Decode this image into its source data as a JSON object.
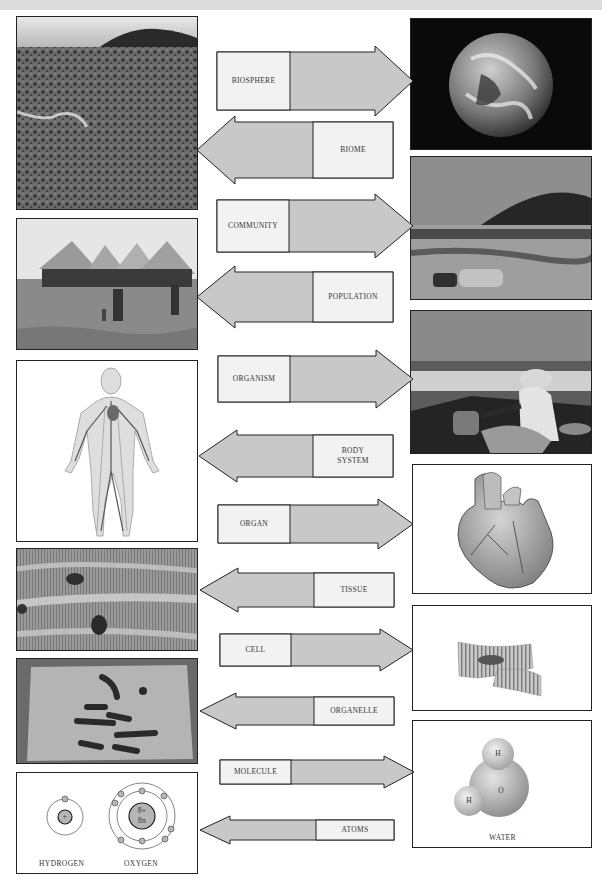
{
  "colors": {
    "arrow_fill": "#c8c8c8",
    "label_fill": "#f2f2f2",
    "stroke": "#222222",
    "top_bar": "#dcdcdc"
  },
  "levels": [
    {
      "label": "BIOSPHERE",
      "direction": "right",
      "image": "earth-photo"
    },
    {
      "label": "BIOME",
      "direction": "left",
      "image": "savanna-landscape-photo"
    },
    {
      "label": "COMMUNITY",
      "direction": "right",
      "image": "village-hill-landscape-photo"
    },
    {
      "label": "POPULATION",
      "direction": "left",
      "image": "thatched-huts-village-photo"
    },
    {
      "label": "ORGANISM",
      "direction": "right",
      "image": "woman-working-photo"
    },
    {
      "label_line1": "BODY",
      "label_line2": "SYSTEM",
      "direction": "left",
      "image": "circulatory-system-illustration"
    },
    {
      "label": "ORGAN",
      "direction": "right",
      "image": "heart-illustration"
    },
    {
      "label": "TISSUE",
      "direction": "left",
      "image": "muscle-tissue-micrograph"
    },
    {
      "label": "CELL",
      "direction": "right",
      "image": "muscle-cell-illustration"
    },
    {
      "label": "ORGANELLE",
      "direction": "left",
      "image": "chromosomes-micrograph"
    },
    {
      "label": "MOLECULE",
      "direction": "right",
      "image": "water-molecule-illustration"
    },
    {
      "label": "ATOMS",
      "direction": "left",
      "image": "atoms-diagram"
    }
  ],
  "water": {
    "caption": "WATER",
    "atom_h1": "H",
    "atom_h2": "H",
    "atom_o": "O"
  },
  "atoms": {
    "hydrogen": {
      "caption": "HYDROGEN",
      "nucleus": "+"
    },
    "oxygen": {
      "caption": "OXYGEN",
      "nucleus_line1": "8+",
      "nucleus_line2": "8n"
    }
  }
}
